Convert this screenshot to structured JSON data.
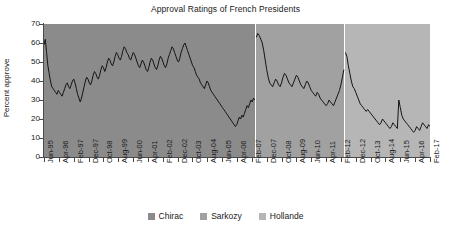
{
  "chart_data": {
    "type": "line",
    "title": "Approval Ratings of French Presidents",
    "xlabel": "",
    "ylabel": "Percent approve",
    "ylim": [
      0,
      70
    ],
    "ytick_step": 10,
    "yticks": [
      70,
      60,
      50,
      40,
      30,
      20,
      10,
      0
    ],
    "grid": false,
    "legend_position": "bottom",
    "x_start": "Jun-95",
    "x_end": "Feb-17",
    "x_tick_interval_months": 10,
    "xticks": [
      "Jun-95",
      "Apr-96",
      "Feb-97",
      "Dec-97",
      "Oct-98",
      "Aug-99",
      "Jun-00",
      "Apr-01",
      "Feb-02",
      "Dec-02",
      "Oct-03",
      "Aug-04",
      "Jun-05",
      "Apr-06",
      "Feb-07",
      "Dec-07",
      "Oct-08",
      "Aug-09",
      "Jun-10",
      "Apr-11",
      "Feb-12",
      "Dec-12",
      "Oct-13",
      "Aug-14",
      "Jun-15",
      "Apr-16",
      "Feb-17"
    ],
    "colors": {
      "chirac_band": "#8b8b8b",
      "sarkozy_band": "#a1a1a1",
      "hollande_band": "#b6b6b6",
      "line": "#141414"
    },
    "series": [
      {
        "name": "Chirac",
        "band_color": "#8b8b8b",
        "start": "Jun-95",
        "end": "Apr-07",
        "values": [
          59,
          62,
          55,
          48,
          44,
          40,
          37,
          36,
          35,
          34,
          33,
          35,
          34,
          33,
          32,
          34,
          36,
          38,
          39,
          37,
          36,
          38,
          40,
          41,
          39,
          36,
          33,
          31,
          29,
          31,
          34,
          37,
          40,
          42,
          41,
          39,
          38,
          40,
          43,
          45,
          44,
          42,
          41,
          43,
          46,
          48,
          47,
          45,
          47,
          50,
          52,
          51,
          49,
          48,
          50,
          53,
          55,
          54,
          52,
          51,
          53,
          56,
          58,
          57,
          55,
          54,
          52,
          51,
          53,
          55,
          54,
          52,
          50,
          48,
          47,
          49,
          51,
          50,
          48,
          46,
          45,
          47,
          50,
          52,
          51,
          49,
          47,
          46,
          48,
          51,
          53,
          52,
          50,
          48,
          47,
          49,
          52,
          54,
          56,
          58,
          57,
          55,
          53,
          51,
          50,
          52,
          55,
          57,
          59,
          60,
          58,
          56,
          54,
          52,
          50,
          48,
          47,
          45,
          43,
          42,
          41,
          39,
          38,
          37,
          36,
          38,
          40,
          39,
          37,
          35,
          34,
          33,
          32,
          31,
          30,
          29,
          28,
          27,
          26,
          25,
          24,
          23,
          22,
          21,
          20,
          19,
          18,
          17,
          16,
          17,
          19,
          21,
          20,
          22,
          21,
          23,
          25,
          27,
          26,
          28,
          30,
          29,
          31,
          30
        ]
      },
      {
        "name": "Sarkozy",
        "band_color": "#a1a1a1",
        "start": "May-07",
        "end": "Apr-12",
        "values": [
          63,
          65,
          64,
          62,
          60,
          56,
          51,
          46,
          42,
          39,
          38,
          37,
          39,
          41,
          40,
          38,
          37,
          39,
          42,
          44,
          43,
          41,
          39,
          38,
          37,
          39,
          41,
          43,
          42,
          40,
          38,
          37,
          36,
          38,
          40,
          39,
          37,
          35,
          34,
          33,
          32,
          34,
          33,
          31,
          30,
          29,
          28,
          27,
          28,
          30,
          29,
          28,
          27,
          29,
          31,
          33,
          35,
          38,
          42,
          46
        ]
      },
      {
        "name": "Hollande",
        "band_color": "#b6b6b6",
        "start": "May-12",
        "end": "Feb-17",
        "values": [
          55,
          53,
          48,
          44,
          40,
          37,
          36,
          34,
          32,
          30,
          28,
          27,
          26,
          25,
          24,
          25,
          24,
          23,
          22,
          21,
          20,
          19,
          18,
          17,
          18,
          20,
          19,
          18,
          17,
          16,
          15,
          16,
          18,
          17,
          16,
          15,
          30,
          26,
          22,
          20,
          19,
          18,
          17,
          16,
          15,
          14,
          13,
          14,
          16,
          15,
          14,
          16,
          18,
          17,
          16,
          15,
          17,
          16
        ]
      }
    ]
  },
  "legend": {
    "items": [
      {
        "label": "Chirac",
        "color": "#8b8b8b"
      },
      {
        "label": "Sarkozy",
        "color": "#a1a1a1"
      },
      {
        "label": "Hollande",
        "color": "#b6b6b6"
      }
    ]
  }
}
